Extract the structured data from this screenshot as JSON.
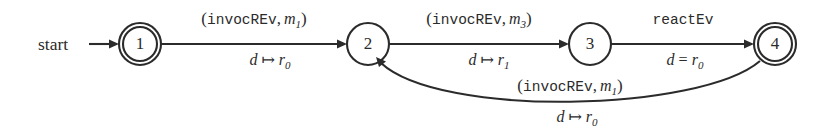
{
  "figure": {
    "type": "finite-state-automaton",
    "background_color": "#ffffff",
    "stroke_color": "#2b2b2b"
  },
  "start": {
    "label": "start",
    "target_state": "1"
  },
  "states": [
    {
      "id": "s1",
      "label": "1",
      "accepting": true,
      "cx": 140,
      "cy": 44,
      "r": 21
    },
    {
      "id": "s2",
      "label": "2",
      "accepting": false,
      "cx": 368,
      "cy": 44,
      "r": 21
    },
    {
      "id": "s3",
      "label": "3",
      "accepting": false,
      "cx": 590,
      "cy": 44,
      "r": 21
    },
    {
      "id": "s4",
      "label": "4",
      "accepting": true,
      "cx": 775,
      "cy": 44,
      "r": 21
    }
  ],
  "transitions": [
    {
      "id": "t1",
      "from": "1",
      "to": "2",
      "event_open": "(",
      "event_name": "invocREv",
      "event_comma": ",",
      "event_param": "m",
      "event_param_sub": "1",
      "event_close": ")",
      "guard_var": "d",
      "guard_op": "↦",
      "guard_val": "r",
      "guard_val_sub": "0"
    },
    {
      "id": "t2",
      "from": "2",
      "to": "3",
      "event_open": "(",
      "event_name": "invocREv",
      "event_comma": ",",
      "event_param": "m",
      "event_param_sub": "3",
      "event_close": ")",
      "guard_var": "d",
      "guard_op": "↦",
      "guard_val": "r",
      "guard_val_sub": "1"
    },
    {
      "id": "t3",
      "from": "3",
      "to": "4",
      "event_open": "",
      "event_name": "reactEv",
      "event_comma": "",
      "event_param": "",
      "event_param_sub": "",
      "event_close": "",
      "guard_var": "d",
      "guard_op": "=",
      "guard_val": "r",
      "guard_val_sub": "0"
    },
    {
      "id": "t4",
      "from": "4",
      "to": "2",
      "event_open": "(",
      "event_name": "invocREv",
      "event_comma": ",",
      "event_param": "m",
      "event_param_sub": "1",
      "event_close": ")",
      "guard_var": "d",
      "guard_op": "↦",
      "guard_val": "r",
      "guard_val_sub": "0"
    }
  ]
}
